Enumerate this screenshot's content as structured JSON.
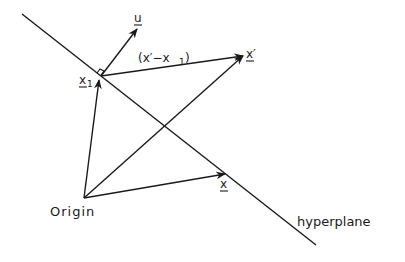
{
  "diagram": {
    "labels": {
      "u": "u",
      "x1": "x",
      "x1_sub": "1",
      "diff": "(x′−x",
      "diff_sub": "1",
      "diff_close": ")",
      "x_prime": "x′",
      "x": "x",
      "origin": "Origin",
      "hyperplane": "hyperplane"
    },
    "colors": {
      "stroke": "#1a1a1a",
      "background": "#ffffff"
    }
  }
}
